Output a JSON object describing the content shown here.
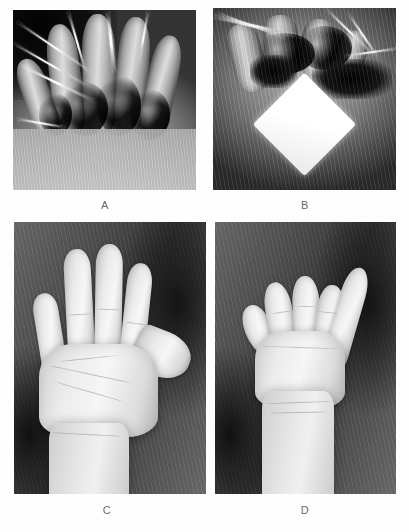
{
  "figure": {
    "background_color": "#fefefe",
    "layout": "2x2-grid",
    "panel_count": 4,
    "caption_color": "#6a6a6a",
    "panels": [
      {
        "id": "A",
        "label": "A",
        "name": "panel-a-intraoperative-degloved-hand",
        "modality": "clinical-photograph",
        "color_mode": "grayscale",
        "description": "Intraoperative view of a degloved hand injury with exposed tissue and multiple metallic K-wires inserted through the fingers",
        "x": 13,
        "y": 10,
        "width": 183,
        "height": 180
      },
      {
        "id": "B",
        "label": "B",
        "name": "panel-b-intraoperative-wound-with-gauze",
        "modality": "clinical-photograph",
        "color_mode": "grayscale",
        "description": "Intraoperative view of the injured hand with sutured wound edges and a white diamond-shaped gauze marker placed on the surgical drape",
        "x": 213,
        "y": 8,
        "width": 183,
        "height": 182
      },
      {
        "id": "C",
        "label": "C",
        "name": "panel-c-postoperative-extension",
        "modality": "clinical-photograph",
        "color_mode": "grayscale",
        "description": "Postoperative result showing the palm with fingers fully extended against a dark fabric background",
        "x": 14,
        "y": 222,
        "width": 192,
        "height": 272
      },
      {
        "id": "D",
        "label": "D",
        "name": "panel-d-postoperative-flexion",
        "modality": "clinical-photograph",
        "color_mode": "grayscale",
        "description": "Postoperative result showing the hand with fingers flexed into a fist and the thumb abducted, demonstrating recovered grip function",
        "x": 215,
        "y": 222,
        "width": 181,
        "height": 272
      }
    ],
    "captions": [
      {
        "text": "A",
        "x": 105,
        "y": 200
      },
      {
        "text": "B",
        "x": 305,
        "y": 200
      },
      {
        "text": "C",
        "x": 107,
        "y": 505
      },
      {
        "text": "D",
        "x": 305,
        "y": 505
      }
    ]
  }
}
